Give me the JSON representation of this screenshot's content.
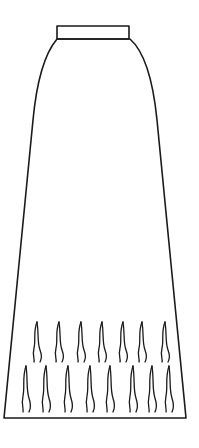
{
  "illustration": {
    "subject": "A-line maxi skirt line drawing",
    "colors": {
      "background": "#ffffff",
      "line": "#1a1a1a"
    },
    "waistband": {
      "x": 57,
      "y": 26,
      "width": 72,
      "height": 13
    },
    "hem": {
      "left_x": 4,
      "right_x": 186,
      "y": 418
    },
    "fringe_rows": [
      {
        "y_top": 322,
        "y_bottom": 362,
        "x_positions": [
          35,
          57,
          79,
          100,
          121,
          140,
          163
        ]
      },
      {
        "y_top": 366,
        "y_bottom": 412,
        "x_positions": [
          24,
          44,
          66,
          88,
          108,
          131,
          150,
          167
        ]
      }
    ]
  }
}
